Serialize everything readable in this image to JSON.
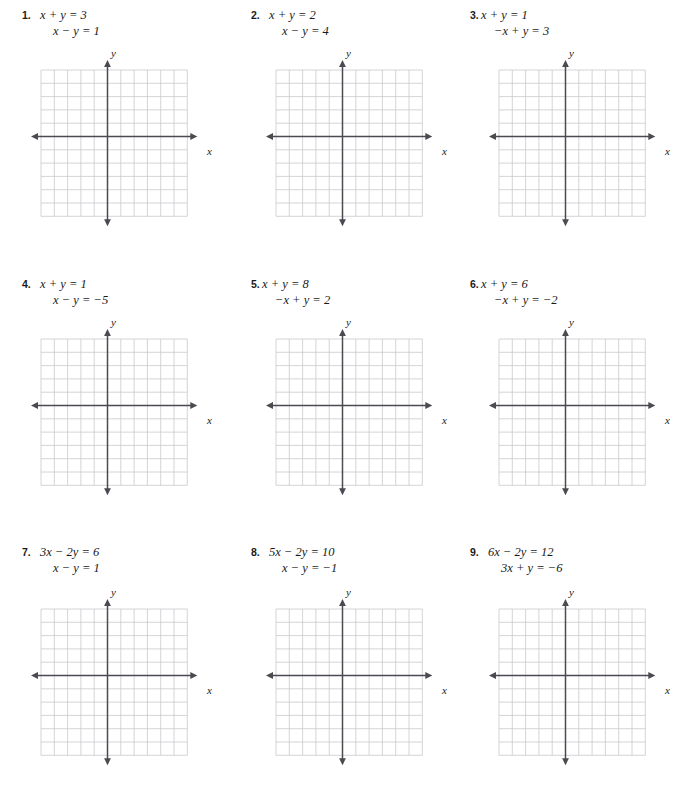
{
  "document": {
    "type": "math-worksheet",
    "topic": "Solve each system by graphing",
    "header_faint": "",
    "problem_count": 9,
    "columns": 3,
    "rows": 3
  },
  "graph": {
    "grid_cells_x": 11,
    "grid_cells_y": 11,
    "grid_color": "#c9c9ce",
    "axis_color": "#4a4a50",
    "x_axis_label": "x",
    "y_axis_label": "y",
    "origin_cell_x": 5,
    "origin_cell_y": 5
  },
  "problems": [
    {
      "number": "1.",
      "indent": false,
      "equations": [
        {
          "lhs": "x + y",
          "rhs": "3",
          "text": "x + y = 3"
        },
        {
          "lhs": "x − y",
          "rhs": "1",
          "text": "x − y = 1"
        }
      ]
    },
    {
      "number": "2.",
      "indent": false,
      "equations": [
        {
          "lhs": "x + y",
          "rhs": "2",
          "text": "x + y = 2"
        },
        {
          "lhs": "x − y",
          "rhs": "4",
          "text": "x − y = 4"
        }
      ]
    },
    {
      "number": "3.",
      "indent": true,
      "equations": [
        {
          "lhs": "x + y",
          "rhs": "1",
          "text": "x + y = 1"
        },
        {
          "lhs": "−x + y",
          "rhs": "3",
          "text": "−x + y = 3"
        }
      ]
    },
    {
      "number": "4.",
      "indent": false,
      "equations": [
        {
          "lhs": "x + y",
          "rhs": "1",
          "text": "x + y = 1"
        },
        {
          "lhs": "x − y",
          "rhs": "−5",
          "text": "x − y = −5"
        }
      ]
    },
    {
      "number": "5.",
      "indent": true,
      "equations": [
        {
          "lhs": "x + y",
          "rhs": "8",
          "text": "x + y = 8"
        },
        {
          "lhs": "−x + y",
          "rhs": "2",
          "text": "−x + y = 2"
        }
      ]
    },
    {
      "number": "6.",
      "indent": true,
      "equations": [
        {
          "lhs": "x + y",
          "rhs": "6",
          "text": "x + y = 6"
        },
        {
          "lhs": "−x + y",
          "rhs": "−2",
          "text": "−x + y = −2"
        }
      ]
    },
    {
      "number": "7.",
      "indent": false,
      "equations": [
        {
          "lhs": "3x − 2y",
          "rhs": "6",
          "text": "3x − 2y = 6"
        },
        {
          "lhs": "x − y",
          "rhs": "1",
          "text": "x − y = 1"
        }
      ]
    },
    {
      "number": "8.",
      "indent": false,
      "equations": [
        {
          "lhs": "5x − 2y",
          "rhs": "10",
          "text": "5x − 2y = 10"
        },
        {
          "lhs": "x − y",
          "rhs": "−1",
          "text": "x − y = −1"
        }
      ]
    },
    {
      "number": "9.",
      "indent": false,
      "equations": [
        {
          "lhs": "6x − 2y",
          "rhs": "12",
          "text": "6x − 2y = 12"
        },
        {
          "lhs": "3x + y",
          "rhs": "−6",
          "text": "3x + y = −6"
        }
      ]
    }
  ]
}
